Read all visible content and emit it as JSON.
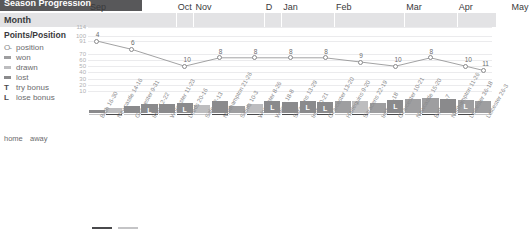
{
  "title": "Season Progression",
  "header": {
    "month_label": "Month"
  },
  "legend": {
    "title": "Points/Position",
    "items": [
      {
        "glyph": "O-",
        "label": "position",
        "icon": "position-icon"
      },
      {
        "glyph": "",
        "label": "won",
        "icon": "won-swatch"
      },
      {
        "glyph": "",
        "label": "drawn",
        "icon": "drawn-swatch"
      },
      {
        "glyph": "",
        "label": "lost",
        "icon": "lost-swatch"
      },
      {
        "glyph": "T",
        "label": "try bonus",
        "icon": "try-bonus-icon"
      },
      {
        "glyph": "L",
        "label": "lose bonus",
        "icon": "lose-bonus-icon"
      }
    ],
    "home_label": "home",
    "away_label": "away"
  },
  "colors": {
    "title_bar": "#58585a",
    "month_band": "#e3e3e5",
    "won": "#9e9ea0",
    "drawn": "#bdbdbf",
    "lost": "#8a8a8c",
    "home": "#4a4a4c",
    "away": "#c4c4c6",
    "grid": "#ebebed"
  },
  "chart_data": {
    "type": "line",
    "title": "Season Progression",
    "xlabel": "",
    "ylabel": "Points/Position",
    "ylim": [
      0,
      114
    ],
    "grid": true,
    "legend_position": "left",
    "yticks": [
      114,
      100,
      91,
      70,
      60,
      50,
      40,
      30,
      20,
      10
    ],
    "months": [
      {
        "label": "Sep",
        "span": 5
      },
      {
        "label": "Oct",
        "span": 1
      },
      {
        "label": "Nov",
        "span": 4
      },
      {
        "label": "D",
        "span": 1
      },
      {
        "label": "Jan",
        "span": 3
      },
      {
        "label": "Feb",
        "span": 4
      },
      {
        "label": "Mar",
        "span": 3
      },
      {
        "label": "Apr",
        "span": 3
      },
      {
        "label": "May",
        "span": 2
      }
    ],
    "categories": [
      "Bath 16-30",
      "Newcastle 14-16",
      "Gloucester 9-31",
      "Irish 12-22",
      "Worcester 11-23",
      "Leeds 20-16",
      "Sale 12-13",
      "Northampton 21-26",
      "Saints 10-3",
      "Worcester 8-26",
      "Wasps 18-8",
      "Saracens 13-29",
      "Irish 20-21",
      "Gloucester 13-20",
      "Harlequins 9-20",
      "Saracens 22-19",
      "Irish 22-18",
      "Gloucester 10-21",
      "Newcastle 15-20",
      "Bath 20-7",
      "Northampton 11-26",
      "Leicester 36-18",
      "Leicester 26-3"
    ],
    "position_values": [
      4,
      6,
      10,
      8,
      8,
      8,
      8,
      9,
      10,
      8,
      10,
      11
    ],
    "position_label_x_index": [
      0,
      1,
      2,
      3,
      4,
      5,
      6,
      7,
      8,
      9,
      10,
      11
    ],
    "points_bars": [
      {
        "result": "lost",
        "height": 3,
        "venue": "away",
        "bonus": ""
      },
      {
        "result": "drawn",
        "height": 5,
        "venue": "home",
        "bonus": ""
      },
      {
        "result": "lost",
        "height": 7,
        "venue": "away",
        "bonus": ""
      },
      {
        "result": "lost",
        "height": 9,
        "venue": "home",
        "bonus": "L"
      },
      {
        "result": "lost",
        "height": 9,
        "venue": "away",
        "bonus": ""
      },
      {
        "result": "lost",
        "height": 10,
        "venue": "home",
        "bonus": "L"
      },
      {
        "result": "drawn",
        "height": 8,
        "venue": "away",
        "bonus": ""
      },
      {
        "result": "lost",
        "height": 12,
        "venue": "home",
        "bonus": ""
      },
      {
        "result": "won",
        "height": 7,
        "venue": "away",
        "bonus": ""
      },
      {
        "result": "drawn",
        "height": 9,
        "venue": "home",
        "bonus": ""
      },
      {
        "result": "lost",
        "height": 12,
        "venue": "away",
        "bonus": "L"
      },
      {
        "result": "lost",
        "height": 11,
        "venue": "home",
        "bonus": ""
      },
      {
        "result": "lost",
        "height": 12,
        "venue": "away",
        "bonus": "L"
      },
      {
        "result": "lost",
        "height": 11,
        "venue": "home",
        "bonus": "L"
      },
      {
        "result": "won",
        "height": 12,
        "venue": "away",
        "bonus": ""
      },
      {
        "result": "drawn",
        "height": 12,
        "venue": "home",
        "bonus": ""
      },
      {
        "result": "won",
        "height": 10,
        "venue": "away",
        "bonus": ""
      },
      {
        "result": "lost",
        "height": 13,
        "venue": "home",
        "bonus": "L"
      },
      {
        "result": "won",
        "height": 14,
        "venue": "away",
        "bonus": ""
      },
      {
        "result": "won",
        "height": 15,
        "venue": "home",
        "bonus": ""
      },
      {
        "result": "lost",
        "height": 14,
        "venue": "away",
        "bonus": ""
      },
      {
        "result": "won",
        "height": 13,
        "venue": "home",
        "bonus": "L"
      },
      {
        "result": "won",
        "height": 12,
        "venue": "away",
        "bonus": ""
      }
    ]
  }
}
